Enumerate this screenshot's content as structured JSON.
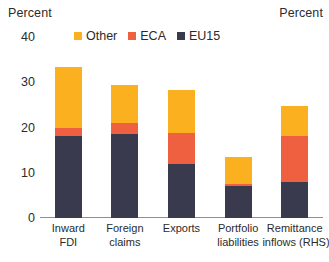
{
  "axis_captions": {
    "left": "Percent",
    "right": "Percent"
  },
  "legend": {
    "items": [
      {
        "label": "Other",
        "color": "#FBB01F"
      },
      {
        "label": "ECA",
        "color": "#EE6040"
      },
      {
        "label": "EU15",
        "color": "#3A3A4E"
      }
    ]
  },
  "chart_data": {
    "type": "bar",
    "stacked": true,
    "title": "",
    "subtitle": "",
    "xlabel": "",
    "ylabel": "Percent",
    "ylabel_right": "Percent",
    "ylim": [
      0,
      40
    ],
    "yticks": [
      40,
      30,
      20,
      10,
      0
    ],
    "ytick_labels": [
      "40",
      "30",
      "20",
      "10",
      "0"
    ],
    "grid": false,
    "legend_position": "top-center",
    "categories": [
      "Inward FDI",
      "Foreign claims",
      "Exports",
      "Portfolio liabilities",
      "Remittance inflows (RHS)"
    ],
    "category_lines": [
      [
        "Inward",
        "FDI"
      ],
      [
        "Foreign",
        "claims"
      ],
      [
        "Exports",
        ""
      ],
      [
        "Portfolio",
        "liabilities"
      ],
      [
        "Remittance",
        "inflows (RHS)"
      ]
    ],
    "series": [
      {
        "name": "EU15",
        "color": "#3A3A4E",
        "values": [
          18.1,
          18.6,
          12.0,
          7.1,
          8.0
        ]
      },
      {
        "name": "ECA",
        "color": "#EE6040",
        "values": [
          1.7,
          2.3,
          6.8,
          0.4,
          10.1
        ]
      },
      {
        "name": "Other",
        "color": "#FBB01F",
        "values": [
          13.6,
          8.5,
          9.4,
          5.9,
          6.6
        ]
      }
    ],
    "totals": [
      33.4,
      29.4,
      28.2,
      13.4,
      24.7
    ]
  }
}
